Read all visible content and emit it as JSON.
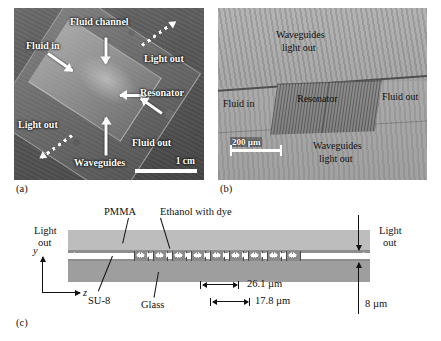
{
  "figure": {
    "panels": [
      {
        "id": "a",
        "caption": "(a)",
        "scale_bar": "1 cm",
        "labels": [
          {
            "key": "fluid_in",
            "text": "Fluid in"
          },
          {
            "key": "fluid_channel",
            "text": "Fluid channel"
          },
          {
            "key": "light_out_tr",
            "text": "Light out"
          },
          {
            "key": "resonator",
            "text": "Resonator"
          },
          {
            "key": "fluid_out",
            "text": "Fluid out"
          },
          {
            "key": "waveguides",
            "text": "Waveguides"
          },
          {
            "key": "light_out_bl",
            "text": "Light out"
          }
        ]
      },
      {
        "id": "b",
        "caption": "(b)",
        "scale_bar": "200 µm",
        "labels": [
          {
            "key": "waveguides_top",
            "line1": "Waveguides",
            "line2": "light out"
          },
          {
            "key": "fluid_in",
            "text": "Fluid in"
          },
          {
            "key": "resonator",
            "text": "Resonator"
          },
          {
            "key": "fluid_out",
            "text": "Fluid out"
          },
          {
            "key": "waveguides_bottom",
            "line1": "Waveguides",
            "line2": "light out"
          }
        ]
      },
      {
        "id": "c",
        "caption": "(c)",
        "labels": {
          "light_out_left_l1": "Light",
          "light_out_left_l2": "out",
          "light_out_right_l1": "Light",
          "light_out_right_l2": "out",
          "pmma": "PMMA",
          "ethanol": "Ethanol with dye",
          "su8": "SU-8",
          "glass": "Glass",
          "axis_y": "y",
          "axis_z": "z"
        },
        "dimensions": [
          {
            "key": "period",
            "value": "26.1 µm"
          },
          {
            "key": "segment",
            "value": "17.8 µm"
          },
          {
            "key": "core_height",
            "value": "8 µm"
          }
        ],
        "segment_count": 9
      }
    ]
  },
  "colors": {
    "pmma_layer": "#bdbdbd",
    "glass_layer": "#9e9e9e",
    "su8_layer": "#8e8e8e",
    "core_strip": "#ffffff",
    "segment_fill": "#8a8a8a",
    "ink": "#111111",
    "page_background": "#ffffff"
  }
}
